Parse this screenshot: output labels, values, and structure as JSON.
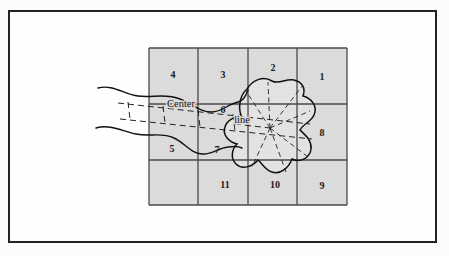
{
  "figure": {
    "title_visible": false,
    "frame": {
      "border_color": "#232323",
      "background": "#ffffff"
    },
    "cell_fill": "#dcdcdc",
    "grid_line_color": "#4a4a4a",
    "curve_color": "#111111",
    "dashed_color": "#222222"
  },
  "grid": {
    "columns": 4,
    "rows": 3,
    "x_lines": [
      149,
      198,
      248,
      297,
      347
    ],
    "y_lines": [
      48,
      104,
      160,
      205
    ],
    "cells": [
      {
        "id": "r1c1",
        "label": "4",
        "cx": 173,
        "cy": 76
      },
      {
        "id": "r1c2",
        "label": "3",
        "cx": 223,
        "cy": 76
      },
      {
        "id": "r1c3",
        "label": "2",
        "cx": 273,
        "cy": 69
      },
      {
        "id": "r1c4",
        "label": "1",
        "cx": 322,
        "cy": 78
      },
      {
        "id": "r2c1",
        "label": "5",
        "cx": 172,
        "cy": 150
      },
      {
        "id": "r2c2a",
        "label": "6",
        "cx": 223,
        "cy": 111
      },
      {
        "id": "r2c2b",
        "label": "7",
        "cx": 217,
        "cy": 151
      },
      {
        "id": "r2c4",
        "label": "8",
        "cx": 322,
        "cy": 134
      },
      {
        "id": "r3c2",
        "label": "11",
        "cx": 225,
        "cy": 186
      },
      {
        "id": "r3c3",
        "label": "10",
        "cx": 275,
        "cy": 186
      },
      {
        "id": "r3c4",
        "label": "9",
        "cx": 322,
        "cy": 187
      }
    ]
  },
  "annotations": [
    {
      "name": "center-label",
      "text": "Center",
      "x": 181,
      "y": 105
    },
    {
      "name": "line-label",
      "text": "line",
      "x": 242,
      "y": 121
    }
  ],
  "center_line": {
    "description": "Dashed corridor band crossing the grid, labelled Center line",
    "convergence_point": {
      "x": 270,
      "y": 128
    }
  },
  "radial_lines": {
    "count": 7,
    "origin": {
      "x": 270,
      "y": 128
    },
    "endpoints": [
      {
        "x": 246,
        "y": 91
      },
      {
        "x": 268,
        "y": 82
      },
      {
        "x": 303,
        "y": 85
      },
      {
        "x": 310,
        "y": 111
      },
      {
        "x": 308,
        "y": 157
      },
      {
        "x": 286,
        "y": 172
      },
      {
        "x": 252,
        "y": 167
      }
    ]
  },
  "blob": {
    "name": "irregular-region",
    "fill": "#e3e3e3",
    "stroke": "#111111"
  },
  "river": {
    "name": "river-banks",
    "bank_count": 2,
    "stroke": "#111111"
  }
}
